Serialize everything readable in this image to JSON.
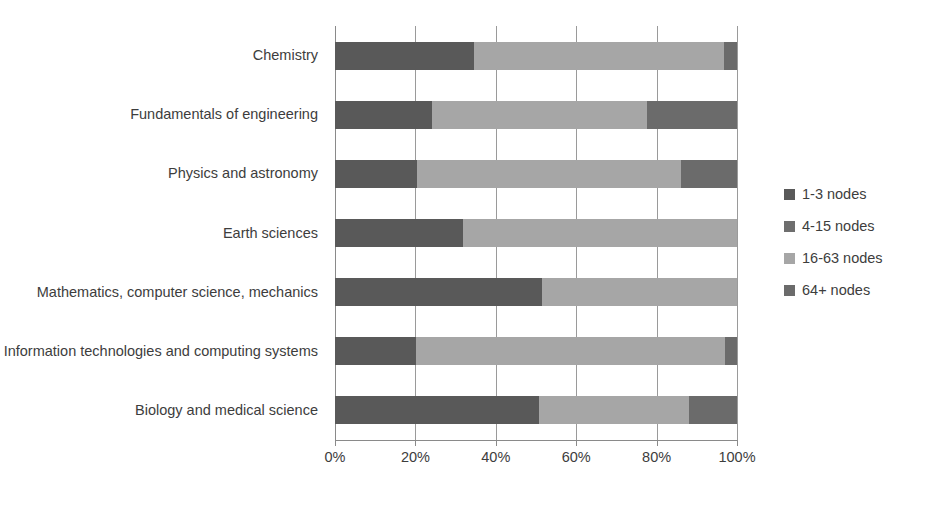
{
  "chart_data": {
    "type": "bar",
    "orientation": "horizontal",
    "stacked": true,
    "stack_mode": "percent",
    "title": "",
    "xlabel": "",
    "ylabel": "",
    "xlim": [
      0,
      100
    ],
    "xticks": [
      0,
      20,
      40,
      60,
      80,
      100
    ],
    "xtick_labels": [
      "0%",
      "20%",
      "40%",
      "60%",
      "80%",
      "100%"
    ],
    "grid": true,
    "legend_position": "right",
    "categories": [
      "Chemistry",
      "Fundamentals of engineering",
      "Physics and astronomy",
      "Earth sciences",
      "Mathematics, computer science, mechanics",
      "Information technologies and computing systems",
      "Biology and medical science"
    ],
    "series": [
      {
        "name": "1-3 nodes",
        "color": "#595959",
        "values": [
          34.5,
          24.1,
          20.4,
          31.8,
          51.5,
          20.1,
          50.7
        ]
      },
      {
        "name": "4-15 nodes",
        "color": "#7f7f7f",
        "values": [
          0,
          0,
          0,
          0,
          0,
          0,
          0
        ]
      },
      {
        "name": "16-63 nodes",
        "color": "#a6a6a6",
        "values": [
          62.3,
          53.5,
          65.7,
          68.2,
          48.5,
          76.9,
          37.3
        ]
      },
      {
        "name": "64+ nodes",
        "color": "#6b6b6b",
        "values": [
          3.2,
          22.4,
          13.9,
          0,
          0,
          3.0,
          12.0
        ]
      }
    ]
  },
  "legend": {
    "items": [
      {
        "label": "1-3 nodes",
        "color": "#595959"
      },
      {
        "label": "4-15 nodes",
        "color": "#6e6e6e"
      },
      {
        "label": "16-63 nodes",
        "color": "#a6a6a6"
      },
      {
        "label": "64+ nodes",
        "color": "#6b6b6b"
      }
    ]
  }
}
